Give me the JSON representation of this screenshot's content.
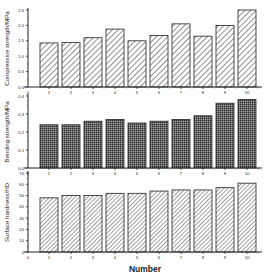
{
  "chart_data": [
    {
      "type": "bar",
      "title": "",
      "xlabel": "",
      "ylabel": "Compressive strength/MPa",
      "categories": [
        "1",
        "2",
        "3",
        "4",
        "5",
        "6",
        "7",
        "8",
        "9",
        "10"
      ],
      "values": [
        1.43,
        1.45,
        1.6,
        1.88,
        1.5,
        1.67,
        2.05,
        1.65,
        2.0,
        2.5
      ],
      "ylim": [
        0,
        2.5
      ],
      "yticks": [
        0.0,
        0.5,
        1.0,
        1.5,
        2.0,
        2.5
      ],
      "ytick_labels": [
        "0.0",
        "0.5",
        "1.0",
        "1.5",
        "2.0",
        "2.5"
      ],
      "pattern": "diagonal-hatch-wide",
      "grid": false
    },
    {
      "type": "bar",
      "title": "",
      "xlabel": "",
      "ylabel": "Bending strength/MPa",
      "categories": [
        "1",
        "2",
        "3",
        "4",
        "5",
        "6",
        "7",
        "8",
        "9",
        "10"
      ],
      "values": [
        0.24,
        0.24,
        0.26,
        0.27,
        0.25,
        0.26,
        0.27,
        0.29,
        0.36,
        0.38
      ],
      "ylim": [
        0,
        0.4
      ],
      "yticks": [
        0.0,
        0.1,
        0.2,
        0.3,
        0.4
      ],
      "ytick_labels": [
        "0.0",
        "0.1",
        "0.2",
        "0.3",
        "0.4"
      ],
      "pattern": "crosshatch-dense",
      "grid": false
    },
    {
      "type": "bar",
      "title": "",
      "xlabel": "Number",
      "ylabel": "Surface hardness/HD",
      "categories": [
        "1",
        "2",
        "3",
        "4",
        "5",
        "6",
        "7",
        "8",
        "9",
        "10"
      ],
      "values": [
        48,
        50,
        50,
        52,
        52,
        54,
        55,
        55,
        57,
        61
      ],
      "ylim": [
        0,
        70
      ],
      "yticks": [
        0,
        10,
        20,
        30,
        40,
        50,
        60,
        70
      ],
      "ytick_labels": [
        "0",
        "10",
        "20",
        "30",
        "40",
        "50",
        "60",
        "70"
      ],
      "pattern": "diagonal-hatch-fine",
      "grid": false
    }
  ],
  "xaxis": {
    "label": "Number",
    "zero_label": "0",
    "ticks": [
      "1",
      "2",
      "3",
      "4",
      "5",
      "6",
      "7",
      "8",
      "9",
      "10"
    ]
  }
}
